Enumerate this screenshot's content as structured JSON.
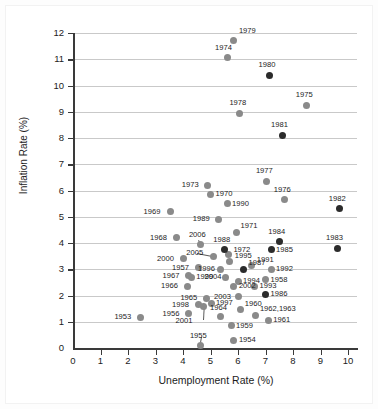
{
  "chart_data": {
    "type": "scatter",
    "title": "",
    "xlabel": "Unemployment Rate (%)",
    "ylabel": "Inflation Rate (%)",
    "xlim": [
      0,
      10.4
    ],
    "ylim": [
      0,
      12.3
    ],
    "xticks": [
      0,
      1,
      2,
      3,
      4,
      5,
      6,
      7,
      8,
      9,
      10
    ],
    "yticks": [
      0,
      1,
      2,
      3,
      4,
      5,
      6,
      7,
      8,
      9,
      10,
      11,
      12
    ],
    "grid": "horizontal",
    "legend": "none",
    "marker_colors": {
      "gray": "#8a8a8a",
      "dark": "#2b2b2b"
    },
    "point_label_field": "year",
    "points": [
      {
        "year": "1953",
        "x": 2.45,
        "y": 1.18,
        "color": "gray",
        "label_dx": -26,
        "label_dy": -4
      },
      {
        "year": "1954",
        "x": 5.85,
        "y": 0.3,
        "color": "gray",
        "label_dx": 5,
        "label_dy": -4
      },
      {
        "year": "1955",
        "x": 4.65,
        "y": 0.1,
        "color": "gray",
        "label_dx": -11,
        "label_dy": -13
      },
      {
        "year": "1956",
        "x": 4.2,
        "y": 1.3,
        "color": "gray",
        "label_dx": -26,
        "label_dy": -4
      },
      {
        "year": "1957",
        "x": 4.55,
        "y": 3.05,
        "color": "gray",
        "label_dx": -26,
        "label_dy": -4
      },
      {
        "year": "1958",
        "x": 7.0,
        "y": 2.6,
        "color": "gray",
        "label_dx": 5,
        "label_dy": -4
      },
      {
        "year": "1959",
        "x": 5.75,
        "y": 0.85,
        "color": "gray",
        "label_dx": 5,
        "label_dy": -4
      },
      {
        "year": "1960",
        "x": 6.1,
        "y": 1.45,
        "color": "gray",
        "label_dx": 4,
        "label_dy": -10
      },
      {
        "year": "1961",
        "x": 7.1,
        "y": 1.05,
        "color": "gray",
        "label_dx": 5,
        "label_dy": -4
      },
      {
        "year": "1962,1963",
        "x": 6.65,
        "y": 1.25,
        "color": "gray",
        "label_dx": 4,
        "label_dy": -10
      },
      {
        "year": "1964",
        "x": 5.35,
        "y": 1.2,
        "color": "gray",
        "label_dx": -10,
        "label_dy": -13
      },
      {
        "year": "1965",
        "x": 4.85,
        "y": 1.9,
        "color": "gray",
        "label_dx": -26,
        "label_dy": -4
      },
      {
        "year": "1966",
        "x": 4.15,
        "y": 2.35,
        "color": "gray",
        "label_dx": -26,
        "label_dy": -4
      },
      {
        "year": "1967",
        "x": 4.2,
        "y": 2.75,
        "color": "gray",
        "label_dx": -26,
        "label_dy": -4
      },
      {
        "year": "1968",
        "x": 3.75,
        "y": 4.2,
        "color": "gray",
        "label_dx": -26,
        "label_dy": -4
      },
      {
        "year": "1969",
        "x": 3.55,
        "y": 5.2,
        "color": "gray",
        "label_dx": -27,
        "label_dy": -4
      },
      {
        "year": "1970",
        "x": 5.0,
        "y": 5.85,
        "color": "gray",
        "label_dx": 5,
        "label_dy": -4
      },
      {
        "year": "1971",
        "x": 5.95,
        "y": 4.4,
        "color": "gray",
        "label_dx": 4,
        "label_dy": -11
      },
      {
        "year": "1972",
        "x": 5.65,
        "y": 3.55,
        "color": "gray",
        "label_dx": 5,
        "label_dy": -9
      },
      {
        "year": "1973",
        "x": 4.9,
        "y": 6.2,
        "color": "gray",
        "label_dx": -26,
        "label_dy": -4
      },
      {
        "year": "1974",
        "x": 5.6,
        "y": 11.05,
        "color": "gray",
        "label_dx": -12,
        "label_dy": -14
      },
      {
        "year": "1975",
        "x": 8.5,
        "y": 9.25,
        "color": "gray",
        "label_dx": -11,
        "label_dy": -14
      },
      {
        "year": "1976",
        "x": 7.7,
        "y": 5.65,
        "color": "gray",
        "label_dx": -11,
        "label_dy": -14
      },
      {
        "year": "1977",
        "x": 7.05,
        "y": 6.35,
        "color": "gray",
        "label_dx": -11,
        "label_dy": -14
      },
      {
        "year": "1978",
        "x": 6.05,
        "y": 8.95,
        "color": "gray",
        "label_dx": -10,
        "label_dy": -14
      },
      {
        "year": "1979",
        "x": 5.85,
        "y": 11.7,
        "color": "gray",
        "label_dx": 5,
        "label_dy": -14
      },
      {
        "year": "1980",
        "x": 7.15,
        "y": 10.4,
        "color": "dark",
        "label_dx": -11,
        "label_dy": -14
      },
      {
        "year": "1981",
        "x": 7.6,
        "y": 8.1,
        "color": "dark",
        "label_dx": -11,
        "label_dy": -14
      },
      {
        "year": "1982",
        "x": 9.7,
        "y": 5.3,
        "color": "dark",
        "label_dx": -11,
        "label_dy": -14
      },
      {
        "year": "1983",
        "x": 9.6,
        "y": 3.8,
        "color": "dark",
        "label_dx": -11,
        "label_dy": -14
      },
      {
        "year": "1984",
        "x": 7.5,
        "y": 4.05,
        "color": "dark",
        "label_dx": -11,
        "label_dy": -14
      },
      {
        "year": "1985",
        "x": 7.2,
        "y": 3.75,
        "color": "dark",
        "label_dx": 5,
        "label_dy": -4
      },
      {
        "year": "1986",
        "x": 7.0,
        "y": 2.05,
        "color": "dark",
        "label_dx": 5,
        "label_dy": -4
      },
      {
        "year": "1987",
        "x": 6.2,
        "y": 3.0,
        "color": "dark",
        "label_dx": 5,
        "label_dy": -10
      },
      {
        "year": "1988",
        "x": 5.5,
        "y": 3.75,
        "color": "dark",
        "label_dx": -11,
        "label_dy": -14
      },
      {
        "year": "1989",
        "x": 5.3,
        "y": 4.9,
        "color": "gray",
        "label_dx": -26,
        "label_dy": -4
      },
      {
        "year": "1990",
        "x": 5.6,
        "y": 5.5,
        "color": "gray",
        "label_dx": 5,
        "label_dy": -4
      },
      {
        "year": "1991",
        "x": 6.5,
        "y": 3.15,
        "color": "gray",
        "label_dx": 5,
        "label_dy": -9
      },
      {
        "year": "1992",
        "x": 7.2,
        "y": 3.0,
        "color": "gray",
        "label_dx": 5,
        "label_dy": -4
      },
      {
        "year": "1993",
        "x": 6.6,
        "y": 2.35,
        "color": "gray",
        "label_dx": 5,
        "label_dy": -4
      },
      {
        "year": "1994",
        "x": 6.0,
        "y": 2.55,
        "color": "gray",
        "label_dx": 5,
        "label_dy": -4
      },
      {
        "year": "1995",
        "x": 5.7,
        "y": 3.3,
        "color": "gray",
        "label_dx": 5,
        "label_dy": -9
      },
      {
        "year": "1996",
        "x": 5.35,
        "y": 3.0,
        "color": "gray",
        "label_dx": -22,
        "label_dy": -4
      },
      {
        "year": "1997",
        "x": 5.05,
        "y": 1.7,
        "color": "gray",
        "label_dx": 4,
        "label_dy": -4
      },
      {
        "year": "1998",
        "x": 4.55,
        "y": 1.65,
        "color": "gray",
        "label_dx": -26,
        "label_dy": -4
      },
      {
        "year": "1999",
        "x": 4.3,
        "y": 2.7,
        "color": "gray",
        "label_dx": 5,
        "label_dy": -4
      },
      {
        "year": "2000",
        "x": 4.0,
        "y": 3.4,
        "color": "gray",
        "label_dx": -26,
        "label_dy": -4
      },
      {
        "year": "2001",
        "x": 4.75,
        "y": 1.6,
        "color": "gray",
        "label_dx": -28,
        "label_dy": 11
      },
      {
        "year": "2002",
        "x": 5.85,
        "y": 2.35,
        "color": "gray",
        "label_dx": 5,
        "label_dy": -4
      },
      {
        "year": "2003",
        "x": 6.0,
        "y": 1.95,
        "color": "gray",
        "label_dx": -24,
        "label_dy": -4
      },
      {
        "year": "2004",
        "x": 5.55,
        "y": 2.7,
        "color": "gray",
        "label_dx": -21,
        "label_dy": -4
      },
      {
        "year": "2005",
        "x": 5.1,
        "y": 3.5,
        "color": "gray",
        "label_dx": -27,
        "label_dy": -7
      },
      {
        "year": "2006",
        "x": 4.65,
        "y": 3.95,
        "color": "gray",
        "label_dx": -12,
        "label_dy": -13
      }
    ],
    "leaders": [
      {
        "from_year": "2005",
        "x1": 4.5,
        "y1": 3.62,
        "x2": 5.1,
        "y2": 3.5
      },
      {
        "from_year": "2006",
        "x1": 4.58,
        "y1": 4.12,
        "x2": 4.65,
        "y2": 3.95
      },
      {
        "from_year": "2001",
        "x1": 4.72,
        "y1": 1.05,
        "x2": 4.75,
        "y2": 1.6
      },
      {
        "from_year": "1955",
        "x1": 4.7,
        "y1": 0.42,
        "x2": 4.65,
        "y2": 0.12
      }
    ]
  }
}
